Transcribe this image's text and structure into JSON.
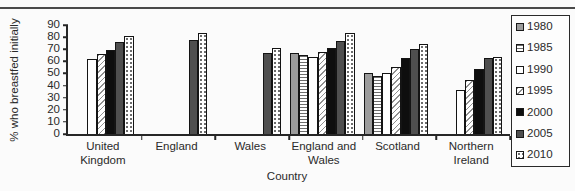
{
  "chart_data": {
    "type": "bar",
    "title": "",
    "xlabel": "Country",
    "ylabel": "% who breastfed initially",
    "ylim": [
      0,
      90
    ],
    "yticks": [
      0,
      10,
      20,
      30,
      40,
      50,
      60,
      70,
      80,
      90
    ],
    "grid": false,
    "legend_position": "right-box",
    "categories": [
      "United Kingdom",
      "England",
      "Wales",
      "England and Wales",
      "Scotland",
      "Northern Ireland"
    ],
    "series": [
      {
        "name": "1980",
        "pattern": "solid-gray",
        "values": [
          null,
          null,
          null,
          67,
          50,
          null
        ]
      },
      {
        "name": "1985",
        "pattern": "horizontal-lines",
        "values": [
          null,
          null,
          null,
          65,
          48,
          null
        ]
      },
      {
        "name": "1990",
        "pattern": "plain-white",
        "values": [
          62,
          null,
          null,
          64,
          50,
          36
        ]
      },
      {
        "name": "1995",
        "pattern": "diagonal-hatch",
        "values": [
          66,
          null,
          null,
          68,
          55,
          45
        ]
      },
      {
        "name": "2000",
        "pattern": "solid-black",
        "values": [
          69,
          null,
          null,
          71,
          63,
          54
        ]
      },
      {
        "name": "2005",
        "pattern": "solid-darkgray",
        "values": [
          76,
          78,
          67,
          77,
          70,
          63
        ]
      },
      {
        "name": "2010",
        "pattern": "dots",
        "values": [
          81,
          83,
          71,
          83,
          74,
          64
        ]
      }
    ],
    "colors": {
      "solid_gray": "#9c9c9c",
      "solid_darkgray": "#4f4f4f",
      "solid_black": "#0e0e0e",
      "bar_border": "#141414",
      "axis": "#262626",
      "top_rule": "#4a4a4a"
    }
  }
}
